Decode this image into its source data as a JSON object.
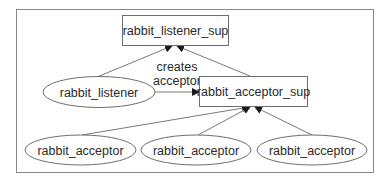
{
  "diagram": {
    "title": "",
    "colors": {
      "frame": "#888888",
      "node_stroke": "#6e6e6e",
      "edge": "#7a7a7a",
      "arrowhead": "#1a1a1a",
      "text": "#2a2a2a",
      "background": "#ffffff"
    },
    "nodes": [
      {
        "id": "listener_sup",
        "shape": "box",
        "label": "rabbit_listener_sup"
      },
      {
        "id": "listener",
        "shape": "ellipse",
        "label": "rabbit_listener"
      },
      {
        "id": "acceptor_sup",
        "shape": "box",
        "label": "rabbit_acceptor_sup"
      },
      {
        "id": "acceptor_1",
        "shape": "ellipse",
        "label": "rabbit_acceptor"
      },
      {
        "id": "acceptor_2",
        "shape": "ellipse",
        "label": "rabbit_acceptor"
      },
      {
        "id": "acceptor_3",
        "shape": "ellipse",
        "label": "rabbit_acceptor"
      }
    ],
    "edges": [
      {
        "from": "listener",
        "to": "listener_sup",
        "label": ""
      },
      {
        "from": "acceptor_sup",
        "to": "listener_sup",
        "label": ""
      },
      {
        "from": "listener",
        "to": "acceptor_sup",
        "label_line1": "creates",
        "label_line2": "acceptor"
      },
      {
        "from": "acceptor_1",
        "to": "acceptor_sup",
        "label": ""
      },
      {
        "from": "acceptor_2",
        "to": "acceptor_sup",
        "label": ""
      },
      {
        "from": "acceptor_3",
        "to": "acceptor_sup",
        "label": ""
      }
    ]
  }
}
